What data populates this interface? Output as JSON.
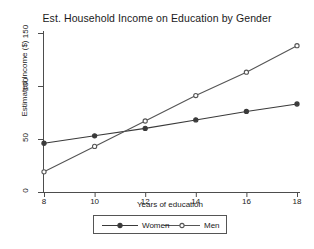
{
  "chart_data": {
    "type": "line",
    "title": "Est. Household Income on Education by Gender",
    "xlabel": "Years of education",
    "ylabel": "Estimated Income ($)",
    "x": [
      8,
      10,
      12,
      14,
      16,
      18
    ],
    "xticks": [
      "8",
      "10",
      "12",
      "14",
      "16",
      "18"
    ],
    "yticks": [
      "0",
      "50",
      "100",
      "150"
    ],
    "ytick_values": [
      0,
      50,
      100,
      150
    ],
    "xlim": [
      8,
      18
    ],
    "ylim": [
      0,
      150
    ],
    "grid": false,
    "legend_position": "bottom-center",
    "series": [
      {
        "name": "Women",
        "values": [
          46,
          53,
          60,
          68,
          76,
          83
        ],
        "marker": "filled-circle",
        "color": "#3a3a3a"
      },
      {
        "name": "Men",
        "values": [
          19,
          43,
          67,
          91,
          113,
          138
        ],
        "marker": "open-circle",
        "color": "#555555"
      }
    ]
  },
  "legend": {
    "entries": [
      {
        "label": "Women"
      },
      {
        "label": "Men"
      }
    ]
  }
}
